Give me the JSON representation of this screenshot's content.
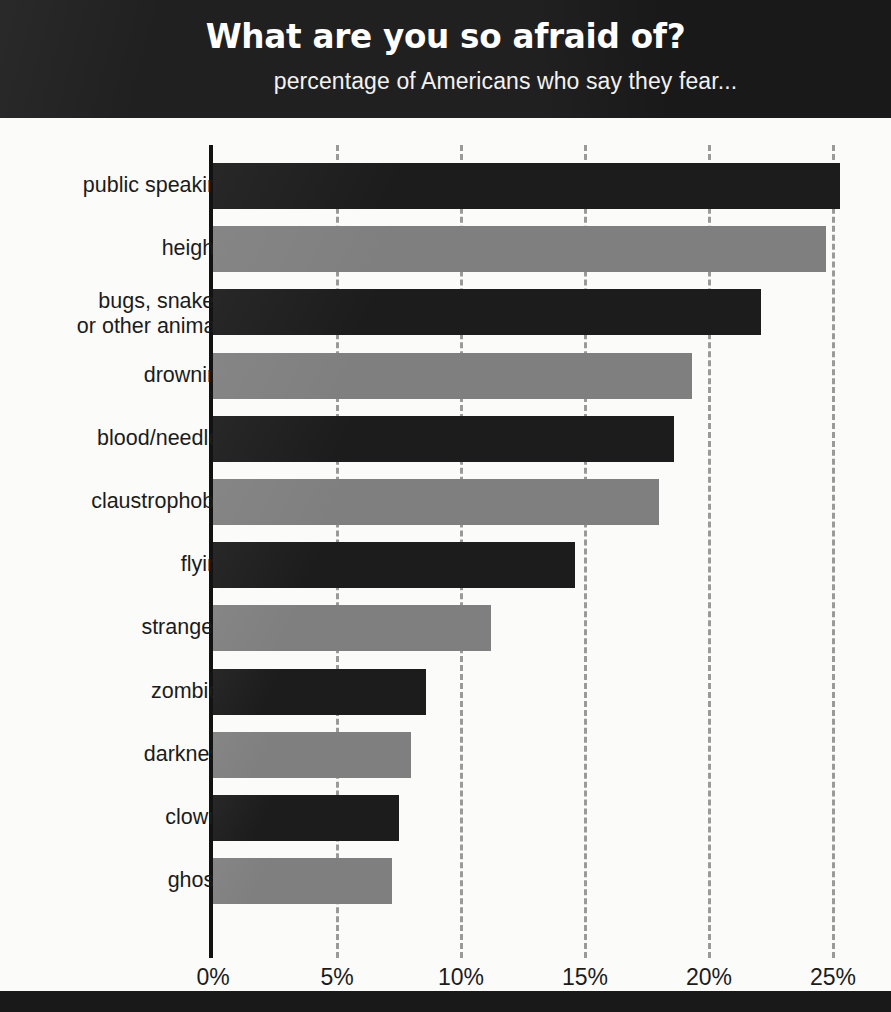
{
  "header": {
    "title": "What are you so afraid of?",
    "subtitle": "percentage of Americans who say they fear..."
  },
  "colors": {
    "band": "#191919",
    "background": "#fbfbf9",
    "bar_dark": "#1c1c1c",
    "bar_light": "#7f7f7f",
    "gridline": "#9a9a9a",
    "text": "#1b1b1b"
  },
  "chart_data": {
    "type": "bar",
    "orientation": "horizontal",
    "title": "What are you so afraid of?",
    "subtitle": "percentage of Americans who say they fear...",
    "xlabel": "",
    "ylabel": "",
    "xlim": [
      0,
      27
    ],
    "xticks": [
      0,
      5,
      10,
      15,
      20,
      25
    ],
    "xtick_labels": [
      "0%",
      "5%",
      "10%",
      "15%",
      "20%",
      "25%"
    ],
    "grid": "vertical dashed gridlines at each x tick",
    "legend": null,
    "categories": [
      "public speaking",
      "heights",
      "bugs, snakes,\nor other animals",
      "drowning",
      "blood/needles",
      "claustrophobia",
      "flying",
      "strangers",
      "zombies",
      "darkness",
      "clowns",
      "ghosts"
    ],
    "values": [
      25.3,
      24.7,
      22.1,
      19.3,
      18.6,
      18.0,
      14.6,
      11.2,
      8.6,
      8.0,
      7.5,
      7.2
    ],
    "bar_colors": [
      "dark",
      "light",
      "dark",
      "light",
      "dark",
      "light",
      "dark",
      "light",
      "dark",
      "light",
      "dark",
      "light"
    ]
  },
  "bars": [
    {
      "label": "public speaking",
      "label_lines": [
        "public speaking"
      ],
      "value": 25.3,
      "style": "dark"
    },
    {
      "label": "heights",
      "label_lines": [
        "heights"
      ],
      "value": 24.7,
      "style": "light"
    },
    {
      "label": "bugs, snakes, or other animals",
      "label_lines": [
        "bugs, snakes,",
        "or other animals"
      ],
      "value": 22.1,
      "style": "dark"
    },
    {
      "label": "drowning",
      "label_lines": [
        "drowning"
      ],
      "value": 19.3,
      "style": "light"
    },
    {
      "label": "blood/needles",
      "label_lines": [
        "blood/needles"
      ],
      "value": 18.6,
      "style": "dark"
    },
    {
      "label": "claustrophobia",
      "label_lines": [
        "claustrophobia"
      ],
      "value": 18.0,
      "style": "light"
    },
    {
      "label": "flying",
      "label_lines": [
        "flying"
      ],
      "value": 14.6,
      "style": "dark"
    },
    {
      "label": "strangers",
      "label_lines": [
        "strangers"
      ],
      "value": 11.2,
      "style": "light"
    },
    {
      "label": "zombies",
      "label_lines": [
        "zombies"
      ],
      "value": 8.6,
      "style": "dark"
    },
    {
      "label": "darkness",
      "label_lines": [
        "darkness"
      ],
      "value": 8.0,
      "style": "light"
    },
    {
      "label": "clowns",
      "label_lines": [
        "clowns"
      ],
      "value": 7.5,
      "style": "dark"
    },
    {
      "label": "ghosts",
      "label_lines": [
        "ghosts"
      ],
      "value": 7.2,
      "style": "light"
    }
  ],
  "xaxis": {
    "ticks": [
      "0%",
      "5%",
      "10%",
      "15%",
      "20%",
      "25%"
    ]
  }
}
